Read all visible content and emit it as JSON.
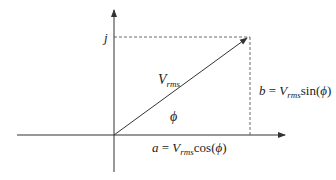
{
  "diagram": {
    "type": "phasor-diagram",
    "axis_labels": {
      "imaginary": "j"
    },
    "vector": {
      "symbol": "V",
      "subscript": "rms"
    },
    "angle": {
      "symbol": "ϕ"
    },
    "real_component": {
      "lhs": "a",
      "eq": " = ",
      "symbol": "V",
      "subscript": "rms",
      "func": "cos(",
      "arg": "ϕ",
      "close": ")"
    },
    "imag_component": {
      "lhs": "b",
      "eq": " = ",
      "symbol": "V",
      "subscript": "rms",
      "func": "sin(",
      "arg": "ϕ",
      "close": ")"
    },
    "colors": {
      "line": "#333333",
      "dashed": "#444444",
      "text": "#222222"
    }
  }
}
